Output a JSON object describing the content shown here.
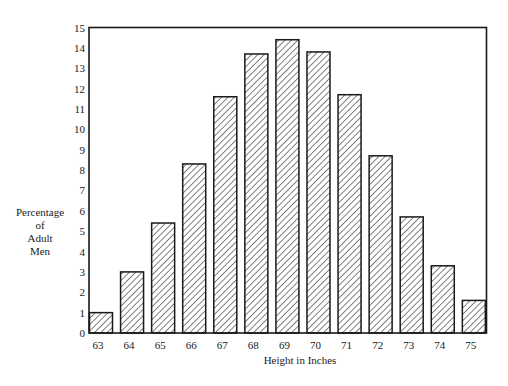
{
  "chart_data": {
    "type": "bar",
    "title": "",
    "xlabel": "Height in Inches",
    "ylabel": [
      "Percentage",
      "of",
      "Adult",
      "Men"
    ],
    "categories": [
      "63",
      "64",
      "65",
      "66",
      "67",
      "68",
      "69",
      "70",
      "71",
      "72",
      "73",
      "74",
      "75"
    ],
    "values": [
      1.0,
      3.0,
      5.4,
      8.3,
      11.6,
      13.7,
      14.4,
      13.8,
      11.7,
      8.7,
      5.7,
      3.3,
      1.6
    ],
    "ylim": [
      0,
      15
    ],
    "yticks": [
      0,
      1,
      2,
      3,
      4,
      5,
      6,
      7,
      8,
      9,
      10,
      11,
      12,
      13,
      14,
      15
    ],
    "grid": false,
    "legend": null,
    "bar_fill": "diagonal-hatch",
    "colors": {
      "stroke": "#1a1a1a",
      "background": "#ffffff"
    }
  }
}
